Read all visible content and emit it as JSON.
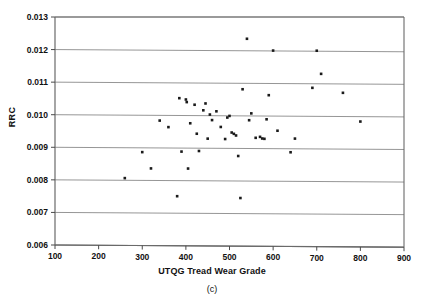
{
  "chart_data": {
    "type": "scatter",
    "title": "",
    "panel_label": "(c)",
    "xlabel": "UTQG Tread Wear Grade",
    "ylabel": "RRC",
    "xlim": [
      100,
      900
    ],
    "ylim": [
      0.006,
      0.013
    ],
    "xticks": [
      100,
      200,
      300,
      400,
      500,
      600,
      700,
      800,
      900
    ],
    "xtick_labels": [
      "100",
      "200",
      "300",
      "400",
      "500",
      "600",
      "700",
      "800",
      "900"
    ],
    "yticks": [
      0.006,
      0.007,
      0.008,
      0.009,
      0.01,
      0.011,
      0.012,
      0.013
    ],
    "ytick_labels": [
      "0.006",
      "0.007",
      "0.008",
      "0.009",
      "0.010",
      "0.011",
      "0.012",
      "0.013"
    ],
    "grid": "horizontal",
    "legend": "none",
    "marker": "square",
    "marker_color": "#1a1a1a",
    "marker_size": 2.6,
    "points": [
      {
        "x": 260,
        "y": 0.00806
      },
      {
        "x": 300,
        "y": 0.00886
      },
      {
        "x": 320,
        "y": 0.00836
      },
      {
        "x": 340,
        "y": 0.00983
      },
      {
        "x": 360,
        "y": 0.00963
      },
      {
        "x": 380,
        "y": 0.00751
      },
      {
        "x": 385,
        "y": 0.01052
      },
      {
        "x": 390,
        "y": 0.00888
      },
      {
        "x": 400,
        "y": 0.01048
      },
      {
        "x": 402,
        "y": 0.0104
      },
      {
        "x": 405,
        "y": 0.00836
      },
      {
        "x": 410,
        "y": 0.00975
      },
      {
        "x": 420,
        "y": 0.01032
      },
      {
        "x": 425,
        "y": 0.00943
      },
      {
        "x": 430,
        "y": 0.0089
      },
      {
        "x": 440,
        "y": 0.01015
      },
      {
        "x": 445,
        "y": 0.01036
      },
      {
        "x": 450,
        "y": 0.00928
      },
      {
        "x": 455,
        "y": 0.01002
      },
      {
        "x": 460,
        "y": 0.00985
      },
      {
        "x": 470,
        "y": 0.01012
      },
      {
        "x": 480,
        "y": 0.00964
      },
      {
        "x": 490,
        "y": 0.00927
      },
      {
        "x": 495,
        "y": 0.00993
      },
      {
        "x": 500,
        "y": 0.00998
      },
      {
        "x": 505,
        "y": 0.00947
      },
      {
        "x": 510,
        "y": 0.00943
      },
      {
        "x": 515,
        "y": 0.00938
      },
      {
        "x": 520,
        "y": 0.00875
      },
      {
        "x": 525,
        "y": 0.00746
      },
      {
        "x": 530,
        "y": 0.0108
      },
      {
        "x": 540,
        "y": 0.01235
      },
      {
        "x": 545,
        "y": 0.00985
      },
      {
        "x": 550,
        "y": 0.01006
      },
      {
        "x": 560,
        "y": 0.00931
      },
      {
        "x": 570,
        "y": 0.00934
      },
      {
        "x": 575,
        "y": 0.00929
      },
      {
        "x": 580,
        "y": 0.00928
      },
      {
        "x": 585,
        "y": 0.00988
      },
      {
        "x": 590,
        "y": 0.01062
      },
      {
        "x": 600,
        "y": 0.01199
      },
      {
        "x": 610,
        "y": 0.00953
      },
      {
        "x": 640,
        "y": 0.00887
      },
      {
        "x": 650,
        "y": 0.00929
      },
      {
        "x": 690,
        "y": 0.01085
      },
      {
        "x": 700,
        "y": 0.01199
      },
      {
        "x": 710,
        "y": 0.01128
      },
      {
        "x": 760,
        "y": 0.0107
      },
      {
        "x": 800,
        "y": 0.00982
      }
    ]
  },
  "geometry": {
    "plot_left": 55,
    "plot_right": 404,
    "plot_top": 17,
    "plot_bottom": 245
  }
}
